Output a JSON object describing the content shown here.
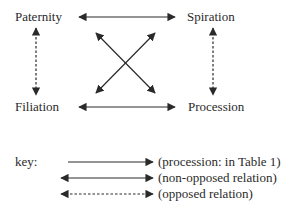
{
  "nodes": {
    "paternity": "Paternity",
    "spiration": "Spiration",
    "filiation": "Filiation",
    "procession": "Procession"
  },
  "edges": [
    {
      "from": "Paternity",
      "to": "Spiration",
      "type": "non-opposed relation"
    },
    {
      "from": "Filiation",
      "to": "Procession",
      "type": "non-opposed relation"
    },
    {
      "from": "Paternity",
      "to": "Procession",
      "type": "non-opposed relation"
    },
    {
      "from": "Spiration",
      "to": "Filiation",
      "type": "non-opposed relation"
    },
    {
      "from": "Paternity",
      "to": "Filiation",
      "type": "opposed relation"
    },
    {
      "from": "Spiration",
      "to": "Procession",
      "type": "opposed relation"
    }
  ],
  "key": {
    "label": "key:",
    "items": [
      {
        "style": "single-arrow-solid",
        "text": "(procession: in Table 1)"
      },
      {
        "style": "double-arrow-solid",
        "text": "(non-opposed relation)"
      },
      {
        "style": "double-arrow-dashed",
        "text": "(opposed relation)"
      }
    ]
  },
  "colors": {
    "ink": "#2a2a2a",
    "background": "#ffffff"
  }
}
